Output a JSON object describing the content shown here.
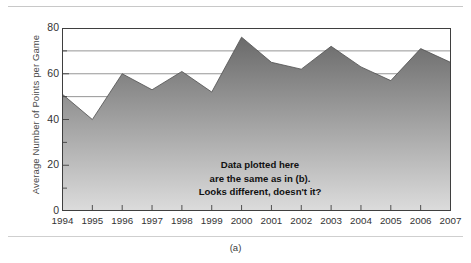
{
  "figure": {
    "panel_label": "(a)",
    "annotation_lines": [
      "Data plotted here",
      "are the same as in (b).",
      "Looks different, doesn't it?"
    ]
  },
  "colors": {
    "fill_top": "#6a6a6a",
    "fill_bottom": "#dcdcdc",
    "axis": "#3f3f3f",
    "gridline": "#8a8a8a",
    "text": "#333333",
    "rule": "#c8c8c8"
  },
  "chart_data": {
    "type": "area",
    "title": "",
    "xlabel": "",
    "ylabel": "Average Number of Points per Game",
    "categories": [
      "1994",
      "1995",
      "1996",
      "1997",
      "1998",
      "1999",
      "2000",
      "2001",
      "2002",
      "2003",
      "2004",
      "2005",
      "2006",
      "2007"
    ],
    "values": [
      51,
      40,
      60,
      53,
      61,
      52,
      76,
      65,
      62,
      72,
      63,
      57,
      71,
      65
    ],
    "ylim": [
      0,
      80
    ],
    "yticks": [
      0,
      20,
      40,
      60,
      80
    ],
    "ytick_labels": [
      "0",
      "20",
      "40",
      "60",
      "80"
    ],
    "gridlines_y": [
      10,
      20,
      30,
      40,
      50,
      60,
      70,
      80
    ],
    "major_gridlines_y": [
      50,
      60,
      70,
      80
    ],
    "grid": true,
    "legend": "none"
  }
}
